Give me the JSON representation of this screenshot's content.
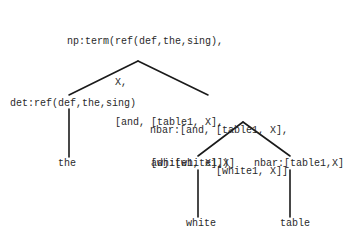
{
  "diagram": {
    "type": "parse-tree",
    "nodes": {
      "root": {
        "lines": [
          "np:term(ref(def,the,sing),",
          "        X,",
          "        [and, [table1, X],",
          "              [white1, X]])"
        ]
      },
      "det": {
        "label": "det:ref(def,the,sing)"
      },
      "nbar": {
        "lines": [
          "nbar:[and, [table1, X],",
          "           [white1, X]]"
        ]
      },
      "det_leaf": {
        "label": "the"
      },
      "adj": {
        "label": "adj:[white1,X]"
      },
      "nbar2": {
        "label": "nbar:[table1,X]"
      },
      "adj_leaf": {
        "label": "white"
      },
      "nbar2_leaf": {
        "label": "table"
      }
    },
    "edges": [
      [
        "root",
        "det"
      ],
      [
        "root",
        "nbar"
      ],
      [
        "det",
        "det_leaf"
      ],
      [
        "nbar",
        "adj"
      ],
      [
        "nbar",
        "nbar2"
      ],
      [
        "adj",
        "adj_leaf"
      ],
      [
        "nbar2",
        "nbar2_leaf"
      ]
    ]
  }
}
